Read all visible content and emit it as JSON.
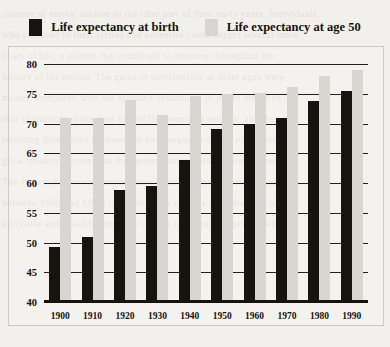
{
  "legend": {
    "items": [
      {
        "label": "Life expectancy at birth",
        "color": "#17140f",
        "key": "birth"
      },
      {
        "label": "Life expectancy at age 50",
        "color": "#d8d6d1",
        "key": "age50"
      }
    ]
  },
  "bleed_text": "sidenoe of mortal decline in the later part of their early years. Individuals\nwho survived to their sixties and seventies could expect several more\nyears of life, a pattern that continued to improve throughout the\nhistory of the period. The gains in survivorship at older ages were\nmodest compared with the dramatic reductions in infant mortality\nthat characterized the first half of the twentieth century, and the\nresulting divergence between the two measures of life expectancy\ngrew steadily narrower as the century progressed toward its end.\nThe figures below summarize these parallel trends for the decades\nbetween 1900 and 1990, illustrating the relative contributions of\nearly-life and late-life mortality change to overall longevity gains.",
  "chart_data": {
    "type": "bar",
    "title": "",
    "xlabel": "",
    "ylabel": "",
    "ylim": [
      40,
      80
    ],
    "yticks": [
      40,
      45,
      50,
      55,
      60,
      65,
      70,
      75,
      80
    ],
    "grid": true,
    "legend_position": "top",
    "categories": [
      "1900",
      "1910",
      "1920",
      "1930",
      "1940",
      "1950",
      "1960",
      "1970",
      "1980",
      "1990"
    ],
    "series": [
      {
        "name": "Life expectancy at birth",
        "color": "#17140f",
        "values": [
          49.2,
          51.0,
          58.9,
          59.5,
          63.8,
          69.0,
          70.0,
          70.9,
          73.8,
          75.4
        ]
      },
      {
        "name": "Life expectancy at age 50",
        "color": "#d8d6d1",
        "values": [
          70.9,
          71.0,
          73.9,
          71.4,
          74.6,
          75.0,
          75.2,
          76.1,
          78.0,
          79.0
        ]
      }
    ]
  }
}
